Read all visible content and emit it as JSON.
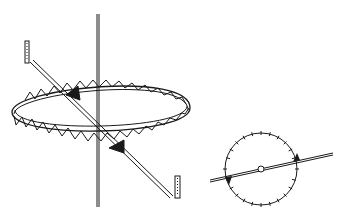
{
  "diagram": {
    "colors": {
      "ink": "#1a1a1a",
      "background": "#ffffff"
    },
    "figures": [
      {
        "name": "toothed-ring-assembly",
        "parts": [
          "vertical-axis",
          "toothed-ring",
          "diagonal-rod",
          "vane-upper",
          "vane-lower",
          "end-bracket-left",
          "end-bracket-right"
        ]
      },
      {
        "name": "top-view-dial",
        "parts": [
          "dial-circle",
          "tick-marks",
          "center-pivot",
          "rod",
          "vane-left",
          "vane-right"
        ]
      }
    ]
  }
}
